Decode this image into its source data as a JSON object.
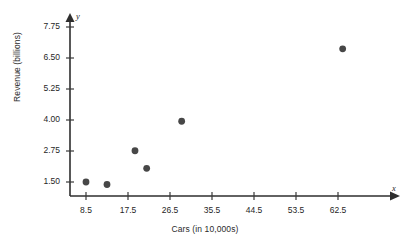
{
  "chart_data": {
    "type": "scatter",
    "title": "",
    "xlabel": "Cars (in 10,000s)",
    "ylabel": "Revenue (billions)",
    "x_axis_letter": "x",
    "y_axis_letter": "y",
    "xlim": [
      4.0,
      67.0
    ],
    "ylim": [
      0.6,
      8.2
    ],
    "grid": false,
    "legend": null,
    "xticks": [
      8.5,
      17.5,
      26.5,
      35.5,
      44.5,
      53.5,
      62.5
    ],
    "xtick_labels": [
      "8.5",
      "17.5",
      "26.5",
      "35.5",
      "44.5",
      "53.5",
      "62.5"
    ],
    "yticks": [
      1.5,
      2.75,
      4.0,
      5.25,
      6.5,
      7.75
    ],
    "ytick_labels": [
      "1.50",
      "2.75",
      "4.00",
      "5.25",
      "6.50",
      "7.75"
    ],
    "points": [
      {
        "x": 8.5,
        "y": 1.5
      },
      {
        "x": 13.0,
        "y": 1.4
      },
      {
        "x": 19.0,
        "y": 2.76
      },
      {
        "x": 21.5,
        "y": 2.05
      },
      {
        "x": 29.0,
        "y": 3.95
      },
      {
        "x": 63.5,
        "y": 6.87
      }
    ],
    "marker_color": "#474747",
    "axis_color": "#2e2e2e"
  }
}
